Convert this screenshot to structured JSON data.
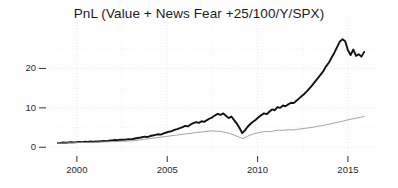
{
  "chart_data": {
    "type": "line",
    "title": "PnL (Value + News Fear +25/100/Y/SPX)",
    "xlabel": "",
    "ylabel": "",
    "xlim": [
      1998.9,
      2016.0
    ],
    "ylim": [
      -1.2,
      29.5
    ],
    "xticks": [
      2000,
      2005,
      2010,
      2015
    ],
    "xticklabels": [
      "2000",
      "2005",
      "2010",
      "2015"
    ],
    "yticks": [
      0,
      10,
      20
    ],
    "yticklabels": [
      "0",
      "10",
      "20"
    ],
    "grid": true,
    "grid_style": "dotted",
    "legend": "none",
    "series": [
      {
        "name": "Value + News Fear strategy",
        "color": "#121212",
        "linewidth": 1.9,
        "x": [
          1998.95,
          1999.1,
          1999.25,
          1999.4,
          1999.55,
          1999.7,
          1999.85,
          2000.0,
          2000.15,
          2000.3,
          2000.45,
          2000.6,
          2000.75,
          2000.9,
          2001.05,
          2001.2,
          2001.35,
          2001.5,
          2001.65,
          2001.8,
          2001.95,
          2002.1,
          2002.25,
          2002.4,
          2002.55,
          2002.7,
          2002.85,
          2003.0,
          2003.15,
          2003.3,
          2003.45,
          2003.6,
          2003.75,
          2003.9,
          2004.05,
          2004.2,
          2004.35,
          2004.5,
          2004.65,
          2004.8,
          2004.95,
          2005.1,
          2005.25,
          2005.4,
          2005.55,
          2005.7,
          2005.85,
          2006.0,
          2006.15,
          2006.3,
          2006.45,
          2006.6,
          2006.75,
          2006.9,
          2007.05,
          2007.2,
          2007.35,
          2007.5,
          2007.65,
          2007.8,
          2007.95,
          2008.1,
          2008.25,
          2008.4,
          2008.55,
          2008.7,
          2008.85,
          2009.0,
          2009.15,
          2009.3,
          2009.45,
          2009.6,
          2009.75,
          2009.9,
          2010.05,
          2010.2,
          2010.35,
          2010.5,
          2010.65,
          2010.8,
          2010.95,
          2011.1,
          2011.25,
          2011.4,
          2011.55,
          2011.7,
          2011.85,
          2012.0,
          2012.15,
          2012.3,
          2012.45,
          2012.6,
          2012.75,
          2012.9,
          2013.05,
          2013.2,
          2013.35,
          2013.5,
          2013.65,
          2013.8,
          2013.95,
          2014.1,
          2014.25,
          2014.4,
          2014.55,
          2014.7,
          2014.85,
          2015.0,
          2015.15,
          2015.3,
          2015.45,
          2015.6,
          2015.75,
          2015.9
        ],
        "y": [
          1.05,
          1.1,
          1.2,
          1.15,
          1.25,
          1.3,
          1.25,
          1.3,
          1.35,
          1.3,
          1.4,
          1.35,
          1.45,
          1.4,
          1.5,
          1.45,
          1.55,
          1.6,
          1.55,
          1.7,
          1.75,
          1.85,
          1.8,
          1.95,
          1.9,
          1.95,
          2.05,
          2.0,
          2.15,
          2.3,
          2.4,
          2.55,
          2.7,
          2.6,
          2.85,
          3.0,
          3.15,
          3.3,
          3.2,
          3.5,
          3.75,
          3.95,
          4.1,
          4.4,
          4.6,
          4.85,
          5.1,
          5.4,
          5.3,
          5.8,
          6.1,
          6.4,
          6.2,
          6.6,
          6.45,
          6.9,
          7.3,
          7.6,
          8.1,
          8.5,
          8.2,
          8.6,
          8.0,
          7.4,
          7.8,
          6.9,
          6.0,
          4.9,
          3.6,
          4.3,
          5.2,
          5.9,
          6.5,
          7.0,
          7.6,
          8.1,
          8.6,
          8.4,
          9.0,
          9.6,
          9.4,
          10.2,
          10.0,
          10.6,
          10.4,
          10.9,
          11.3,
          11.2,
          11.8,
          12.4,
          13.0,
          13.6,
          14.3,
          15.1,
          15.9,
          16.8,
          17.6,
          18.5,
          19.4,
          20.6,
          21.5,
          22.8,
          24.0,
          25.4,
          26.8,
          27.4,
          26.9,
          24.6,
          23.4,
          24.8,
          23.2,
          23.6,
          23.0,
          24.2
        ]
      },
      {
        "name": "SPX benchmark",
        "color": "#9a9a9a",
        "linewidth": 0.9,
        "x": [
          1998.95,
          1999.2,
          1999.45,
          1999.7,
          1999.95,
          2000.2,
          2000.45,
          2000.7,
          2000.95,
          2001.2,
          2001.45,
          2001.7,
          2001.95,
          2002.2,
          2002.45,
          2002.7,
          2002.95,
          2003.2,
          2003.45,
          2003.7,
          2003.95,
          2004.2,
          2004.45,
          2004.7,
          2004.95,
          2005.2,
          2005.45,
          2005.7,
          2005.95,
          2006.2,
          2006.45,
          2006.7,
          2006.95,
          2007.2,
          2007.45,
          2007.7,
          2007.95,
          2008.2,
          2008.45,
          2008.7,
          2008.95,
          2009.2,
          2009.45,
          2009.7,
          2009.95,
          2010.2,
          2010.45,
          2010.7,
          2010.95,
          2011.2,
          2011.45,
          2011.7,
          2011.95,
          2012.2,
          2012.45,
          2012.7,
          2012.95,
          2013.2,
          2013.45,
          2013.7,
          2013.95,
          2014.2,
          2014.45,
          2014.7,
          2014.95,
          2015.2,
          2015.45,
          2015.7,
          2015.9
        ],
        "y": [
          1.0,
          1.05,
          1.1,
          1.12,
          1.15,
          1.2,
          1.22,
          1.25,
          1.28,
          1.3,
          1.35,
          1.38,
          1.42,
          1.45,
          1.5,
          1.55,
          1.6,
          1.7,
          1.85,
          2.0,
          2.15,
          2.3,
          2.45,
          2.6,
          2.75,
          2.9,
          3.05,
          3.2,
          3.35,
          3.5,
          3.65,
          3.8,
          3.9,
          4.05,
          4.15,
          4.1,
          4.0,
          3.8,
          3.5,
          3.1,
          2.6,
          2.2,
          2.8,
          3.3,
          3.6,
          3.85,
          4.0,
          3.95,
          4.2,
          4.35,
          4.3,
          4.45,
          4.4,
          4.55,
          4.7,
          4.85,
          5.0,
          5.2,
          5.4,
          5.6,
          5.85,
          6.1,
          6.35,
          6.6,
          6.9,
          7.15,
          7.4,
          7.6,
          7.8
        ]
      }
    ]
  }
}
